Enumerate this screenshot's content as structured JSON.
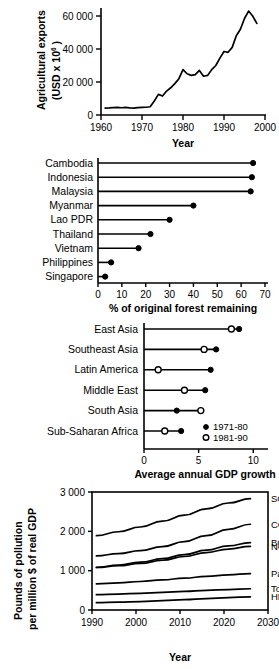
{
  "figure": {
    "panel_count": 4,
    "panels": [
      "agricultural-exports",
      "forest-remaining",
      "gdp-growth",
      "pollution-intensity"
    ]
  },
  "chart_data": [
    {
      "id": "agricultural-exports",
      "type": "line",
      "title": "",
      "xlabel": "Year",
      "ylabel": "Agricultural exports (USD x 10^6)",
      "ylabel_line1": "Agricultural exports",
      "ylabel_line2_pre": "(USD x 10",
      "ylabel_line2_sup": "6",
      "ylabel_line2_post": " )",
      "xlim": [
        1960,
        2000
      ],
      "ylim": [
        0,
        65000
      ],
      "xticks": [
        1960,
        1970,
        1980,
        1990,
        2000
      ],
      "xticklabels": [
        "1960",
        "1970",
        "1980",
        "1990",
        "2000"
      ],
      "yticks": [
        0,
        20000,
        40000,
        60000
      ],
      "yticklabels": [
        "0",
        "20 000",
        "40 000",
        "60 000"
      ],
      "grid": false,
      "legend": "none",
      "series": [
        {
          "name": "Agricultural exports",
          "x": [
            1961,
            1962,
            1963,
            1964,
            1965,
            1966,
            1967,
            1968,
            1969,
            1970,
            1971,
            1972,
            1973,
            1974,
            1975,
            1976,
            1977,
            1978,
            1979,
            1980,
            1981,
            1982,
            1983,
            1984,
            1985,
            1986,
            1987,
            1988,
            1989,
            1990,
            1991,
            1992,
            1993,
            1994,
            1995,
            1996,
            1997,
            1998
          ],
          "values": [
            4200,
            4300,
            4500,
            4600,
            4400,
            4600,
            4300,
            4200,
            4500,
            4600,
            4700,
            5000,
            8500,
            12500,
            11500,
            14500,
            16500,
            19000,
            22000,
            27500,
            25000,
            24000,
            24500,
            27000,
            23500,
            24000,
            27500,
            30000,
            34500,
            38500,
            38000,
            41000,
            48000,
            52000,
            58500,
            63000,
            60000,
            55500
          ]
        }
      ]
    },
    {
      "id": "forest-remaining",
      "type": "bar",
      "orientation": "horizontal-lollipop",
      "title": "",
      "xlabel": "% of original forest remaining",
      "ylabel": "",
      "xlim": [
        0,
        70
      ],
      "xticks": [
        0,
        10,
        20,
        30,
        40,
        50,
        60,
        70
      ],
      "xticklabels": [
        "0",
        "10",
        "20",
        "30",
        "40",
        "50",
        "60",
        "70"
      ],
      "grid": false,
      "legend": "none",
      "categories": [
        "Cambodia",
        "Indonesia",
        "Malaysia",
        "Myanmar",
        "Lao PDR",
        "Thailand",
        "Vietnam",
        "Philippines",
        "Singapore"
      ],
      "values": [
        65.0,
        64.5,
        64.0,
        40.0,
        30.0,
        22.0,
        17.0,
        5.5,
        3.0
      ]
    },
    {
      "id": "gdp-growth",
      "type": "bar",
      "orientation": "horizontal-dumbbell",
      "title": "",
      "xlabel": "Average annual GDP growth",
      "ylabel": "",
      "xlim": [
        0,
        10.8
      ],
      "xticks": [
        0,
        5,
        10
      ],
      "xticklabels": [
        "0",
        "5",
        "10"
      ],
      "grid": false,
      "legend": "inside-bottom-right",
      "categories": [
        "East Asia",
        "Southeast Asia",
        "Latin America",
        "Middle East",
        "South Asia",
        "Sub-Saharan Africa"
      ],
      "series": [
        {
          "name": "1971-80",
          "marker": "filled-circle",
          "values": [
            8.7,
            6.6,
            6.1,
            5.6,
            3.0,
            3.4
          ]
        },
        {
          "name": "1981-90",
          "marker": "open-circle",
          "values": [
            8.0,
            5.5,
            1.3,
            3.7,
            5.2,
            1.9
          ]
        }
      ],
      "legend_entries": [
        {
          "label": "1971-80",
          "marker": "filled-circle"
        },
        {
          "label": "1981-90",
          "marker": "open-circle"
        }
      ]
    },
    {
      "id": "pollution-intensity",
      "type": "line",
      "title": "",
      "xlabel": "Year",
      "ylabel": "Pounds of pollution per million $ of real GDP",
      "ylabel_line1": "Pounds of pollution",
      "ylabel_line2": "per million $ of real GDP",
      "xlim": [
        1990,
        2030
      ],
      "ylim": [
        0,
        3000
      ],
      "xticks": [
        1990,
        2000,
        2010,
        2020,
        2030
      ],
      "xticklabels": [
        "1990",
        "2000",
        "2010",
        "2020",
        "2030"
      ],
      "yticks": [
        0,
        1000,
        2000,
        3000
      ],
      "yticklabels": [
        "0",
        "1 000",
        "2 000",
        "3 000"
      ],
      "grid": false,
      "frame": "box",
      "legend": "right-end-labels",
      "x": [
        1991,
        1996,
        2001,
        2006,
        2011,
        2016,
        2021,
        2026
      ],
      "series": [
        {
          "name": "SO2",
          "label_main": "SO",
          "label_sub": "2",
          "values": [
            1890,
            1990,
            2110,
            2260,
            2410,
            2570,
            2720,
            2830
          ]
        },
        {
          "name": "CO",
          "label_main": "CO",
          "label_sub": "",
          "values": [
            1375,
            1435,
            1510,
            1610,
            1740,
            1890,
            2050,
            2180
          ]
        },
        {
          "name": "BOD",
          "label_main": "BOD",
          "label_sub": "",
          "values": [
            1085,
            1140,
            1215,
            1305,
            1410,
            1520,
            1630,
            1715
          ]
        },
        {
          "name": "NO2",
          "label_main": "NO",
          "label_sub": "2",
          "values": [
            1080,
            1125,
            1185,
            1265,
            1360,
            1460,
            1550,
            1620
          ]
        },
        {
          "name": "Part.",
          "label_main": "Part.",
          "label_sub": "",
          "values": [
            665,
            690,
            725,
            765,
            810,
            855,
            895,
            925
          ]
        },
        {
          "name": "Toxic",
          "label_main": "Toxic",
          "label_sub": "",
          "values": [
            390,
            405,
            425,
            450,
            475,
            500,
            520,
            540
          ]
        },
        {
          "name": "HM",
          "label_main": "HM",
          "label_sub": "",
          "values": [
            185,
            200,
            215,
            240,
            265,
            290,
            315,
            335
          ]
        }
      ]
    }
  ]
}
